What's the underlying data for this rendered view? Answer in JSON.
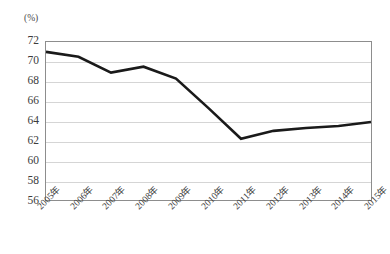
{
  "chart_data": {
    "type": "line",
    "title": "",
    "subtitle": "",
    "xlabel": "",
    "ylabel": "(%)",
    "unit_label": "(%)",
    "categories": [
      "2005年",
      "2006年",
      "2007年",
      "2008年",
      "2009年",
      "2010年",
      "2011年",
      "2012年",
      "2013年",
      "2014年",
      "2015年"
    ],
    "x": [
      2005,
      2006,
      2007,
      2008,
      2009,
      2010,
      2011,
      2012,
      2013,
      2014,
      2015
    ],
    "values": [
      71.0,
      70.5,
      68.9,
      69.5,
      68.3,
      65.3,
      62.2,
      63.0,
      63.3,
      63.5,
      63.9
    ],
    "series": [
      {
        "name": "",
        "values": [
          71.0,
          70.5,
          68.9,
          69.5,
          68.3,
          65.3,
          62.2,
          63.0,
          63.3,
          63.5,
          63.9
        ]
      }
    ],
    "ylim": [
      56,
      72
    ],
    "ytick_step": 2,
    "yticks": [
      72,
      70,
      68,
      66,
      64,
      62,
      60,
      58,
      56
    ],
    "ytick_labels": [
      "72",
      "70",
      "68",
      "66",
      "64",
      "62",
      "60",
      "58",
      "56"
    ],
    "xtick_labels": [
      "2005年",
      "2006年",
      "2007年",
      "2008年",
      "2009年",
      "2010年",
      "2011年",
      "2012年",
      "2013年",
      "2014年",
      "2015年"
    ],
    "xtick_rotation": -45,
    "grid": true,
    "grid_axis": "y",
    "legend": false,
    "legend_position": "none",
    "markers": false,
    "annotations": [],
    "colors": {
      "line": "#1a1a1a",
      "grid": "#d5d5d5",
      "frame": "#8d8d8d",
      "background": "#ffffff",
      "text": "#3c3c3c"
    },
    "line_width": 2.6
  }
}
